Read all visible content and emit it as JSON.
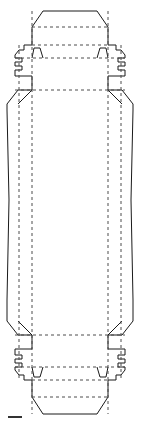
{
  "document": {
    "title": "Carton Dieline",
    "subject": "folding carton blank / packaging net",
    "background_color": "#ffffff"
  },
  "drawing": {
    "width": 141,
    "height": 425,
    "line_styles": {
      "cut_line": {
        "name": "cut line",
        "color": "#1a1a1a",
        "width": 1,
        "dash": "solid"
      },
      "crease_line": {
        "name": "crease / fold line",
        "color": "#4d4d4d",
        "width": 1,
        "dash": "3 3"
      },
      "scale_bar": {
        "name": "scale bar",
        "color": "#333333",
        "width": 2,
        "dash": "solid"
      }
    },
    "geometry": {
      "cut_outline": "M 43 11 L 97 11 L 108 27 L 108 45 L 116 45 L 116 50 L 121 50 L 125 55 L 125 58 L 118 58 L 118 62 L 125 62 L 125 66 L 118 66 L 118 70 L 125 70 L 125 76 L 121 76 L 108 76 L 108 90 L 122 90 L 133 104 L 133 110 L 131 200 L 133 300 L 133 321 L 122 335 L 108 335 L 108 349 L 121 349 L 125 349 L 125 355 L 118 355 L 118 359 L 125 359 L 125 363 L 118 363 L 118 367 L 125 367 L 125 370 L 121 375 L 116 375 L 116 380 L 108 380 L 108 397 L 97 414 L 43 414 L 32 397 L 32 380 L 24 380 L 24 375 L 19 375 L 15 370 L 15 367 L 22 367 L 22 363 L 15 363 L 15 359 L 22 359 L 22 355 L 15 355 L 15 349 L 19 349 L 32 349 L 32 335 L 18 335 L 7 321 L 7 300 L 9 200 L 7 110 L 7 104 L 18 90 L 32 90 L 32 76 L 19 76 L 15 76 L 15 70 L 22 70 L 22 66 L 15 66 L 15 62 L 22 62 L 22 58 L 15 58 L 15 55 L 19 50 L 24 50 L 24 45 L 32 45 L 32 27 Z",
      "left_top_tab": "M 32 58 L 34 48 L 40 48 L 43 58",
      "right_top_tab": "M 108 58 L 106 48 L 100 48 L 97 58",
      "left_bottom_tab": "M 32 367 L 34 377 L 40 377 L 43 367",
      "right_bottom_tab": "M 108 367 L 106 377 L 100 377 L 97 367",
      "left_top_diagonal": "M 32 90 L 18 104",
      "right_top_diagonal": "M 108 90 L 122 104",
      "left_bottom_diagonal": "M 32 335 L 18 321",
      "right_bottom_diagonal": "M 108 335 L 122 321",
      "crease_vertical_left_outer": "M 19 45 L 19 380",
      "crease_vertical_left_inner": "M 32 11 L 32 414",
      "crease_vertical_right_inner": "M 108 11 L 108 414",
      "crease_vertical_right_outer": "M 121 45 L 121 380",
      "crease_horizontal_top_1": "M 32 27 L 108 27",
      "crease_horizontal_top_2": "M 32 45 L 108 45",
      "crease_horizontal_top_3": "M 15 58 L 125 58",
      "crease_horizontal_top_4": "M 15 90 L 125 90",
      "crease_horizontal_bottom_1": "M 15 335 L 125 335",
      "crease_horizontal_bottom_2": "M 15 367 L 125 367",
      "crease_horizontal_bottom_3": "M 32 380 L 108 380",
      "crease_horizontal_bottom_4": "M 32 397 L 108 397",
      "scale_bar": "M 8 417 L 22 417"
    },
    "panels": [
      {
        "name": "top-closure-flap",
        "label": ""
      },
      {
        "name": "top-tuck-panel",
        "label": ""
      },
      {
        "name": "top-end-panel",
        "label": ""
      },
      {
        "name": "main-front-panel",
        "label": ""
      },
      {
        "name": "left-side-panel",
        "label": ""
      },
      {
        "name": "right-side-panel",
        "label": ""
      },
      {
        "name": "bottom-end-panel",
        "label": ""
      },
      {
        "name": "bottom-tuck-panel",
        "label": ""
      },
      {
        "name": "bottom-closure-flap",
        "label": ""
      }
    ],
    "annotations": []
  }
}
